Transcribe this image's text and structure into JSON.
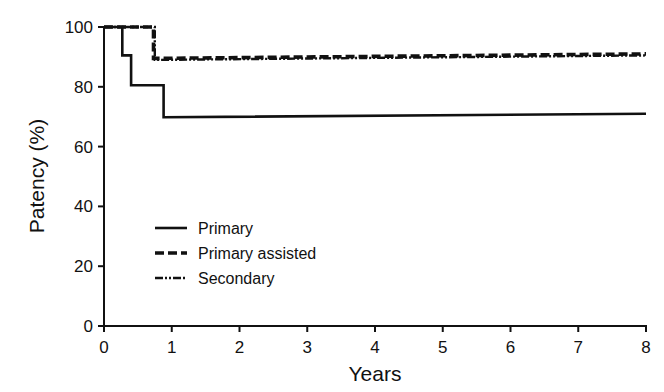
{
  "chart_data": {
    "type": "line",
    "subtype": "kaplan-meier step",
    "title": "",
    "xlabel": "Years",
    "ylabel": "Patency (%)",
    "xlim": [
      0,
      8
    ],
    "ylim": [
      0,
      100
    ],
    "x_ticks": [
      0,
      1,
      2,
      3,
      4,
      5,
      6,
      7,
      8
    ],
    "y_ticks": [
      0,
      20,
      40,
      60,
      80,
      100
    ],
    "grid": false,
    "legend_position": "lower-left inside plot",
    "series": [
      {
        "name": "Primary",
        "style": "solid",
        "points": [
          [
            0,
            100
          ],
          [
            0.27,
            100
          ],
          [
            0.27,
            90.5
          ],
          [
            0.4,
            90.5
          ],
          [
            0.4,
            80.5
          ],
          [
            0.88,
            80.5
          ],
          [
            0.88,
            69.8
          ],
          [
            8,
            71
          ]
        ]
      },
      {
        "name": "Primary assisted",
        "style": "dashed",
        "points": [
          [
            0,
            100
          ],
          [
            0.73,
            100
          ],
          [
            0.73,
            89.5
          ],
          [
            8,
            91
          ]
        ]
      },
      {
        "name": "Secondary",
        "style": "dash-dot-dot",
        "points": [
          [
            0,
            100
          ],
          [
            0.75,
            100
          ],
          [
            0.75,
            89
          ],
          [
            8,
            90.5
          ]
        ]
      }
    ]
  }
}
